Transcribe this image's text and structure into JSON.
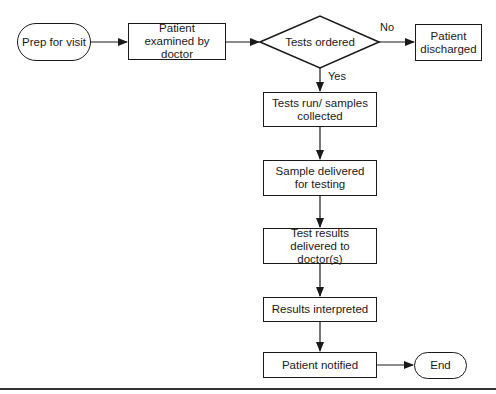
{
  "diagram": {
    "type": "flowchart",
    "nodes": {
      "prep": {
        "label": "Prep for visit",
        "shape": "terminal"
      },
      "examined": {
        "label": "Patient examined by doctor",
        "shape": "process"
      },
      "decision": {
        "label": "Tests ordered",
        "shape": "decision"
      },
      "discharged": {
        "label": "Patient discharged",
        "shape": "process"
      },
      "tests_run": {
        "label": "Tests run/ samples collected",
        "shape": "process"
      },
      "sample_delivered": {
        "label": "Sample delivered for testing",
        "shape": "process"
      },
      "results_delivered": {
        "label": "Test results delivered to doctor(s)",
        "shape": "process"
      },
      "interpreted": {
        "label": "Results interpreted",
        "shape": "process"
      },
      "notified": {
        "label": "Patient notified",
        "shape": "process"
      },
      "end": {
        "label": "End",
        "shape": "terminal"
      }
    },
    "edge_labels": {
      "no": "No",
      "yes": "Yes"
    },
    "edges": [
      {
        "from": "prep",
        "to": "examined"
      },
      {
        "from": "examined",
        "to": "decision"
      },
      {
        "from": "decision",
        "to": "discharged",
        "label": "No"
      },
      {
        "from": "decision",
        "to": "tests_run",
        "label": "Yes"
      },
      {
        "from": "tests_run",
        "to": "sample_delivered"
      },
      {
        "from": "sample_delivered",
        "to": "results_delivered"
      },
      {
        "from": "results_delivered",
        "to": "interpreted"
      },
      {
        "from": "interpreted",
        "to": "notified"
      },
      {
        "from": "notified",
        "to": "end"
      }
    ],
    "colors": {
      "stroke": "#1a1a1a",
      "fill": "#ffffff"
    }
  }
}
